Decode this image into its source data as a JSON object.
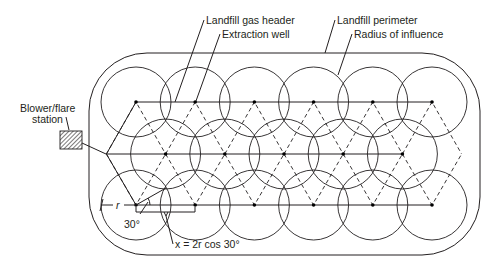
{
  "labels": {
    "header": "Landfill gas header",
    "well": "Extraction well",
    "perimeter": "Landfill perimeter",
    "radius": "Radius of influence",
    "blower_line1": "Blower/flare",
    "blower_line2": "station",
    "r": "r",
    "angle": "30°",
    "formula": "x = 2r cos 30°"
  },
  "layout_spec": {
    "rows": [
      {
        "name": "row-1",
        "wells": 6,
        "offset": false
      },
      {
        "name": "row-2",
        "wells": 5,
        "offset": true
      },
      {
        "name": "row-3",
        "wells": 6,
        "offset": false
      }
    ],
    "pattern": "triangular grid of extraction wells connected by header lines per row"
  },
  "colors": {
    "ink": "#231f20",
    "background": "#ffffff"
  }
}
